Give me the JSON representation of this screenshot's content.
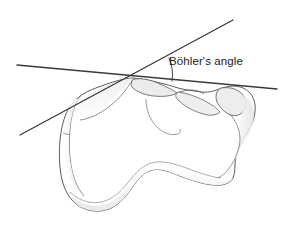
{
  "figure": {
    "title": "Böhler's angle",
    "background_color": "#ffffff"
  },
  "annotation": {
    "label": "Böhler's angle",
    "label_color": "#1a1a1a",
    "label_x": 169,
    "label_y": 55
  },
  "geometry": {
    "vertex": {
      "x": 133,
      "y": 78
    },
    "line_color": "#3a3a3a",
    "arc_color": "#3a3a3a",
    "lines": [
      {
        "name": "superior-tangent-line",
        "x1": 17,
        "y1": 65,
        "x2": 277,
        "y2": 89
      },
      {
        "name": "posterior-tuberosity-line",
        "x1": 20,
        "y1": 135,
        "x2": 233,
        "y2": 20
      }
    ],
    "arc": {
      "name": "angle-arc",
      "center_x": 133,
      "center_y": 78,
      "radius": 40,
      "start_x": 169,
      "start_y": 58,
      "end_x": 172,
      "end_y": 81
    }
  },
  "bone": {
    "name": "calcaneus",
    "outline_color": "#4a4a4a",
    "fill_color": "#ffffff",
    "shade_color": "#e9e9e9",
    "detail_color": "#5a5a5a",
    "parts": [
      "posterior-tuberosity",
      "posterior-facet",
      "sustentaculum-tali",
      "anterior-process",
      "plantar-surface",
      "sinus-tarsi"
    ]
  }
}
